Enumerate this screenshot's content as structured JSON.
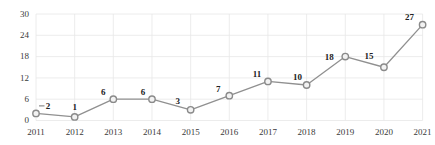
{
  "chart_data": {
    "type": "line",
    "title": "",
    "xlabel": "",
    "ylabel": "",
    "categories": [
      "2011",
      "2012",
      "2013",
      "2014",
      "2015",
      "2016",
      "2017",
      "2018",
      "2019",
      "2020",
      "2021"
    ],
    "series": [
      {
        "name": "annual-count",
        "values": [
          2,
          1,
          6,
          6,
          3,
          7,
          11,
          10,
          18,
          15,
          27
        ]
      }
    ],
    "data_labels": [
      "2",
      "1",
      "6",
      "6",
      "3",
      "7",
      "11",
      "10",
      "18",
      "15",
      "27"
    ],
    "ylim": [
      0,
      30
    ],
    "yticks": [
      0,
      6,
      12,
      18,
      24,
      30
    ],
    "grid": "on",
    "legend": "none",
    "marker_style": "open-circle",
    "colors": {
      "line": "#909090",
      "marker_stroke": "#8a8a8a",
      "marker_fill": "#f2f2f2",
      "grid": "#e7e7e7",
      "tick_text": "#3a3a3a",
      "data_label_text": "#222222",
      "background": "#ffffff"
    }
  }
}
